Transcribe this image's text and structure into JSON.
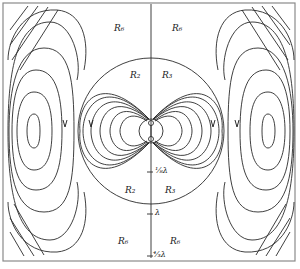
{
  "figure": {
    "type": "dipole field line pattern",
    "region_labels": {
      "top_left_outer": "R₆",
      "top_right_outer": "R₆",
      "top_left_inner": "R₂",
      "top_right_inner": "R₃",
      "bottom_left_inner": "R₂",
      "bottom_right_inner": "R₃",
      "bottom_left_outer": "R₆",
      "bottom_right_outer": "R₆"
    },
    "axis_ticks": [
      {
        "label": "¹⁄₈λ"
      },
      {
        "label": "λ"
      },
      {
        "label": "⁴⁄₃λ"
      }
    ],
    "colors": {
      "line": "#2a2a2a",
      "frame": "#777777",
      "background": "#ffffff"
    }
  }
}
